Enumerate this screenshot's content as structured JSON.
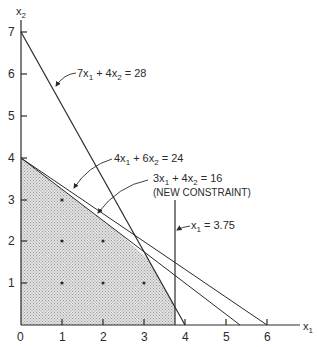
{
  "axes": {
    "x_label": "x",
    "x_label_sub": "1",
    "y_label": "x",
    "y_label_sub": "2",
    "origin_label": "0",
    "x_ticks": [
      "1",
      "2",
      "3",
      "4",
      "5",
      "6"
    ],
    "y_ticks": [
      "1",
      "2",
      "3",
      "4",
      "5",
      "6",
      "7"
    ]
  },
  "constraints": [
    {
      "id": "c1",
      "equation": "7x1 + 4x2 = 28",
      "parts": [
        "7x",
        "1",
        " + 4x",
        "2",
        " = 28"
      ],
      "x_intercept": 4,
      "y_intercept": 7
    },
    {
      "id": "c2",
      "equation": "4x1 + 6x2 = 24",
      "parts": [
        "4x",
        "1",
        " + 6x",
        "2",
        " = 24"
      ],
      "x_intercept": 6,
      "y_intercept": 4
    },
    {
      "id": "c3",
      "equation": "3x1 + 4x2 = 16",
      "parts": [
        "3x",
        "1",
        " + 4x",
        "2",
        " = 16"
      ],
      "note": "(NEW CONSTRAINT)",
      "x_intercept": 5.333,
      "y_intercept": 4
    },
    {
      "id": "c4",
      "equation": "x1 = 3.75",
      "parts": [
        "x",
        "1",
        " = 3.75"
      ],
      "vertical_at": 3.75
    }
  ],
  "feasible_region": {
    "shading": "hatched-gray",
    "vertices": [
      [
        0,
        0
      ],
      [
        0,
        4
      ],
      [
        2.4,
        2.2
      ],
      [
        3.1,
        1.57
      ],
      [
        3.75,
        0.44
      ],
      [
        3.75,
        0
      ]
    ]
  },
  "integer_points": [
    [
      1,
      1
    ],
    [
      2,
      1
    ],
    [
      3,
      1
    ],
    [
      1,
      2
    ],
    [
      2,
      2
    ],
    [
      1,
      3
    ]
  ],
  "colors": {
    "line": "#2a2a2a",
    "region_fill": "#cfcfcf",
    "background": "#ffffff"
  }
}
